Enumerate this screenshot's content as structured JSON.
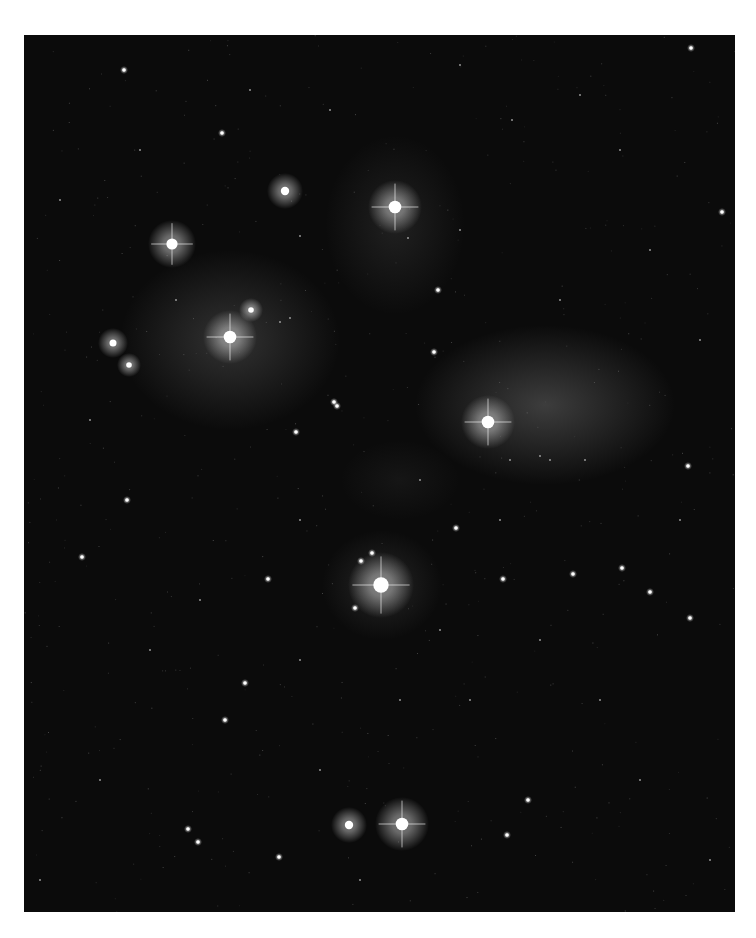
{
  "image": {
    "subject": "Star cluster with reflection nebulosity",
    "background_color": "#0b0b0b",
    "border_color": "#ffffff",
    "frame": {
      "x": 24,
      "y": 35,
      "width": 711,
      "height": 877
    }
  },
  "nebulae": [
    {
      "cx": 230,
      "cy": 340,
      "rx": 110,
      "ry": 90,
      "opacity": 0.22
    },
    {
      "cx": 545,
      "cy": 405,
      "rx": 130,
      "ry": 80,
      "opacity": 0.28
    },
    {
      "cx": 395,
      "cy": 225,
      "rx": 70,
      "ry": 90,
      "opacity": 0.12
    },
    {
      "cx": 382,
      "cy": 585,
      "rx": 60,
      "ry": 55,
      "opacity": 0.15
    },
    {
      "cx": 400,
      "cy": 480,
      "rx": 60,
      "ry": 40,
      "opacity": 0.06
    }
  ],
  "bright_stars": [
    {
      "x": 395,
      "y": 207,
      "r": 9,
      "spikes": true
    },
    {
      "x": 172,
      "y": 244,
      "r": 8,
      "spikes": true
    },
    {
      "x": 230,
      "y": 337,
      "r": 9,
      "spikes": true
    },
    {
      "x": 488,
      "y": 422,
      "r": 9,
      "spikes": true
    },
    {
      "x": 381,
      "y": 585,
      "r": 11,
      "spikes": true
    },
    {
      "x": 402,
      "y": 824,
      "r": 9,
      "spikes": true
    },
    {
      "x": 349,
      "y": 825,
      "r": 6,
      "spikes": false
    },
    {
      "x": 285,
      "y": 191,
      "r": 6,
      "spikes": false
    },
    {
      "x": 113,
      "y": 343,
      "r": 5,
      "spikes": false
    },
    {
      "x": 129,
      "y": 365,
      "r": 4,
      "spikes": false
    },
    {
      "x": 251,
      "y": 310,
      "r": 4,
      "spikes": false
    }
  ],
  "medium_stars": [
    [
      124,
      70
    ],
    [
      691,
      48
    ],
    [
      222,
      133
    ],
    [
      438,
      290
    ],
    [
      434,
      352
    ],
    [
      296,
      432
    ],
    [
      127,
      500
    ],
    [
      268,
      579
    ],
    [
      503,
      579
    ],
    [
      573,
      574
    ],
    [
      622,
      568
    ],
    [
      650,
      592
    ],
    [
      690,
      618
    ],
    [
      688,
      466
    ],
    [
      225,
      720
    ],
    [
      528,
      800
    ],
    [
      198,
      842
    ],
    [
      188,
      829
    ],
    [
      334,
      402
    ],
    [
      337,
      406
    ],
    [
      372,
      553
    ],
    [
      361,
      561
    ],
    [
      355,
      608
    ],
    [
      245,
      683
    ],
    [
      456,
      528
    ],
    [
      82,
      557
    ],
    [
      279,
      857
    ],
    [
      507,
      835
    ],
    [
      722,
      212
    ]
  ],
  "faint_stars": [
    [
      300,
      236
    ],
    [
      176,
      300
    ],
    [
      280,
      322
    ],
    [
      290,
      318
    ],
    [
      408,
      238
    ],
    [
      460,
      230
    ],
    [
      330,
      110
    ],
    [
      512,
      120
    ],
    [
      580,
      95
    ],
    [
      650,
      250
    ],
    [
      700,
      340
    ],
    [
      680,
      520
    ],
    [
      600,
      700
    ],
    [
      540,
      640
    ],
    [
      470,
      700
    ],
    [
      320,
      770
    ],
    [
      150,
      650
    ],
    [
      90,
      420
    ],
    [
      60,
      200
    ],
    [
      140,
      150
    ],
    [
      250,
      90
    ],
    [
      460,
      65
    ],
    [
      620,
      150
    ],
    [
      560,
      300
    ],
    [
      420,
      480
    ],
    [
      300,
      520
    ],
    [
      200,
      600
    ],
    [
      100,
      780
    ],
    [
      400,
      700
    ],
    [
      640,
      780
    ],
    [
      710,
      860
    ],
    [
      40,
      880
    ],
    [
      500,
      520
    ],
    [
      540,
      456
    ],
    [
      550,
      460
    ],
    [
      510,
      460
    ],
    [
      585,
      460
    ],
    [
      360,
      880
    ],
    [
      300,
      660
    ],
    [
      440,
      630
    ]
  ]
}
